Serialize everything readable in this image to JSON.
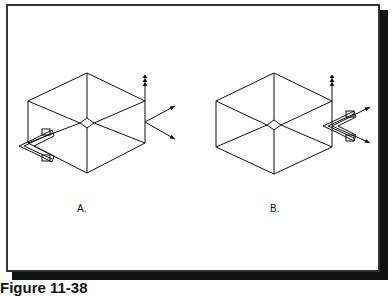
{
  "figure": {
    "caption": "Figure 11-38",
    "panels": [
      {
        "id": "A",
        "label": "A."
      },
      {
        "id": "B",
        "label": "B."
      }
    ]
  },
  "colors": {
    "line": "#111111",
    "background": "#ffffff",
    "shadow": "#111111"
  }
}
